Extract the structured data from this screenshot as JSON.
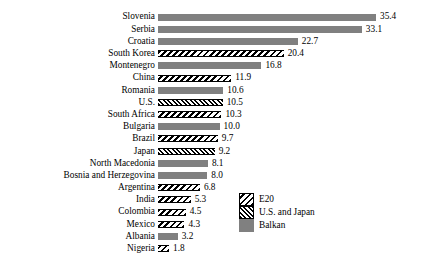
{
  "chart_data": {
    "type": "bar",
    "orientation": "horizontal",
    "title": "",
    "xlabel": "",
    "ylabel": "",
    "grid": false,
    "xlim": [
      0,
      35.4
    ],
    "axis_visible": false,
    "value_labels": true,
    "legend": {
      "position": "bottom-right",
      "entries": [
        {
          "label": "E20",
          "pattern": "e20"
        },
        {
          "label": "U.S. and Japan",
          "pattern": "usjp"
        },
        {
          "label": "Balkan",
          "pattern": "balkan"
        }
      ]
    },
    "colors": {
      "balkan": "#808080",
      "hatch_line": "#000000",
      "hatch_background": "#ffffff",
      "text": "#000000",
      "page_background": "#ffffff"
    },
    "categories": [
      "Slovenia",
      "Serbia",
      "Croatia",
      "South Korea",
      "Montenegro",
      "China",
      "Romania",
      "U.S.",
      "South Africa",
      "Bulgaria",
      "Brazil",
      "Japan",
      "North Macedonia",
      "Bosnia and Herzegovina",
      "Argentina",
      "India",
      "Colombia",
      "Mexico",
      "Albania",
      "Nigeria"
    ],
    "values": [
      35.4,
      33.1,
      22.7,
      20.4,
      16.8,
      11.9,
      10.6,
      10.5,
      10.3,
      10.0,
      9.7,
      9.2,
      8.1,
      8.0,
      6.8,
      5.3,
      4.5,
      4.3,
      3.2,
      1.8
    ],
    "value_label_text": [
      "35.4",
      "33.1",
      "22.7",
      "20.4",
      "16.8",
      "11.9",
      "10.6",
      "10.5",
      "10.3",
      "10.0",
      "9.7",
      "9.2",
      "8.1",
      "8.0",
      "6.8",
      "5.3",
      "4.5",
      "4.3",
      "3.2",
      "1.8"
    ],
    "groups": [
      "balkan",
      "balkan",
      "balkan",
      "e20",
      "balkan",
      "e20",
      "balkan",
      "usjp",
      "e20",
      "balkan",
      "e20",
      "usjp",
      "balkan",
      "balkan",
      "e20",
      "e20",
      "e20",
      "e20",
      "balkan",
      "e20"
    ]
  }
}
